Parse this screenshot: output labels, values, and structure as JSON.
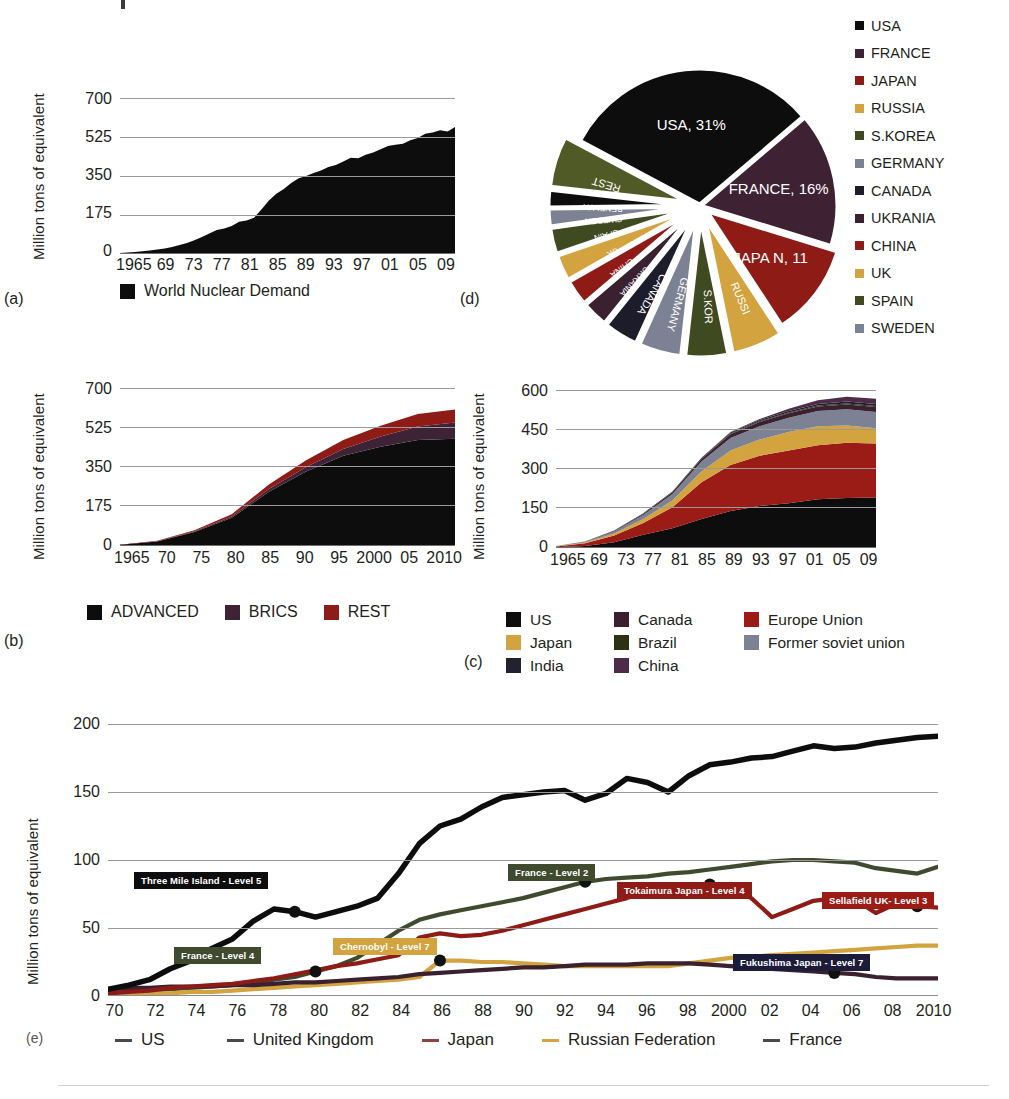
{
  "page": {
    "background": "#ffffff",
    "axis_label": "Million tons of equivalent"
  },
  "panels": {
    "a": {
      "id": "(a)",
      "ylabel": "Million tons of equivalent",
      "yticks": [
        "0",
        "175",
        "350",
        "525",
        "700"
      ],
      "xticks": [
        "1965",
        "69",
        "73",
        "77",
        "81",
        "85",
        "89",
        "93",
        "97",
        "01",
        "05",
        "09"
      ],
      "legend": [
        {
          "label": "World Nuclear Demand",
          "color": "#0d0d0d"
        }
      ]
    },
    "b": {
      "id": "(b)",
      "ylabel": "Million tons of equivalent",
      "yticks": [
        "0",
        "175",
        "350",
        "525",
        "700"
      ],
      "xticks": [
        "1965",
        "70",
        "75",
        "80",
        "85",
        "90",
        "95",
        "2000",
        "05",
        "2010"
      ],
      "legend": [
        {
          "label": "ADVANCED",
          "color": "#0d0d0d"
        },
        {
          "label": "BRICS",
          "color": "#3e2236"
        },
        {
          "label": "REST",
          "color": "#8e1b16"
        }
      ]
    },
    "c": {
      "id": "(c)",
      "ylabel": "Million tons of equivalent",
      "yticks": [
        "0",
        "150",
        "300",
        "450",
        "600"
      ],
      "xticks": [
        "1965",
        "69",
        "73",
        "77",
        "81",
        "85",
        "89",
        "93",
        "97",
        "01",
        "05",
        "09"
      ],
      "legend": [
        {
          "label": "US",
          "color": "#0d0d0d"
        },
        {
          "label": "Canada",
          "color": "#3b2030"
        },
        {
          "label": "Europe Union",
          "color": "#9b1b17"
        },
        {
          "label": "Japan",
          "color": "#d2a33f"
        },
        {
          "label": "Brazil",
          "color": "#2c3315"
        },
        {
          "label": "Former soviet union",
          "color": "#7c8293"
        },
        {
          "label": "India",
          "color": "#22222e"
        },
        {
          "label": "China",
          "color": "#4d2b49"
        }
      ]
    },
    "d": {
      "id": "(d)",
      "legend": [
        {
          "label": "USA",
          "color": "#0d0d0d"
        },
        {
          "label": "FRANCE",
          "color": "#3e2234"
        },
        {
          "label": "JAPAN",
          "color": "#8e1b16"
        },
        {
          "label": "RUSSIA",
          "color": "#d2a33f"
        },
        {
          "label": "S.KOREA",
          "color": "#3f4a21"
        },
        {
          "label": "GERMANY",
          "color": "#7c8293"
        },
        {
          "label": "CANADA",
          "color": "#1c1c2a"
        },
        {
          "label": "UKRANIA",
          "color": "#3b2030"
        },
        {
          "label": "CHINA",
          "color": "#8e1b16"
        },
        {
          "label": "UK",
          "color": "#d2a33f"
        },
        {
          "label": "SPAIN",
          "color": "#3f4a21"
        },
        {
          "label": "SWEDEN",
          "color": "#7c8293"
        }
      ]
    },
    "e": {
      "id": "(e)",
      "ylabel": "Million tons of equivalent",
      "yticks": [
        "0",
        "50",
        "100",
        "150",
        "200"
      ],
      "xticks": [
        "70",
        "72",
        "74",
        "76",
        "78",
        "80",
        "82",
        "84",
        "86",
        "88",
        "90",
        "92",
        "94",
        "96",
        "98",
        "2000",
        "02",
        "04",
        "06",
        "08",
        "2010"
      ],
      "legend": [
        {
          "label": "US",
          "color": "#0d0d0d"
        },
        {
          "label": "United Kingdom",
          "color": "#3b2030"
        },
        {
          "label": "Japan",
          "color": "#8e1b16"
        },
        {
          "label": "Russian Federation",
          "color": "#d2a33f"
        },
        {
          "label": "France",
          "color": "#3f4a2e"
        }
      ],
      "annotations": [
        {
          "text": "Three Mile Island - Level 5",
          "color": "#0d0d0d"
        },
        {
          "text": "France - Level 4",
          "color": "#3f4a2e"
        },
        {
          "text": "Chernobyl - Level 7",
          "color": "#d2a33f"
        },
        {
          "text": "France - Level 2",
          "color": "#3f4a2e"
        },
        {
          "text": "Tokaimura Japan - Level 4",
          "color": "#8e1b16"
        },
        {
          "text": "Fukushima Japan - Level 7",
          "color": "#9b1b17"
        },
        {
          "text": "Sellafield UK- Level 3",
          "color": "#1c1c3a"
        }
      ]
    }
  },
  "chart_data": [
    {
      "key": "a",
      "type": "area",
      "title": "",
      "xlabel": "",
      "ylabel": "Million tons of equivalent",
      "ylim": [
        0,
        700
      ],
      "xlim": [
        1965,
        2010
      ],
      "grid": true,
      "legend_position": "bottom",
      "x": [
        1965,
        1966,
        1967,
        1968,
        1969,
        1970,
        1971,
        1972,
        1973,
        1974,
        1975,
        1976,
        1977,
        1978,
        1979,
        1980,
        1981,
        1982,
        1983,
        1984,
        1985,
        1986,
        1987,
        1988,
        1989,
        1990,
        1991,
        1992,
        1993,
        1994,
        1995,
        1996,
        1997,
        1998,
        1999,
        2000,
        2001,
        2002,
        2003,
        2004,
        2005,
        2006,
        2007,
        2008,
        2009,
        2010
      ],
      "series": [
        {
          "name": "World Nuclear Demand",
          "color": "#0d0d0d",
          "values": [
            5,
            7,
            9,
            12,
            16,
            20,
            25,
            32,
            40,
            50,
            62,
            76,
            92,
            108,
            114,
            125,
            145,
            150,
            163,
            200,
            240,
            270,
            292,
            318,
            340,
            350,
            363,
            375,
            390,
            400,
            415,
            432,
            430,
            445,
            455,
            470,
            485,
            490,
            495,
            510,
            520,
            540,
            545,
            555,
            550,
            570
          ]
        }
      ]
    },
    {
      "key": "b",
      "type": "stacked-area",
      "ylabel": "Million tons of equivalent",
      "ylim": [
        0,
        700
      ],
      "xlim": [
        1965,
        2010
      ],
      "grid": true,
      "legend_position": "bottom",
      "x": [
        1965,
        1970,
        1975,
        1980,
        1985,
        1990,
        1995,
        2000,
        2005,
        2010
      ],
      "series": [
        {
          "name": "ADVANCED",
          "color": "#0d0d0d",
          "values": [
            5,
            20,
            62,
            125,
            240,
            330,
            400,
            440,
            470,
            475
          ]
        },
        {
          "name": "BRICS",
          "color": "#3e2236",
          "values": [
            0,
            1,
            3,
            6,
            12,
            20,
            30,
            45,
            60,
            72
          ]
        },
        {
          "name": "REST",
          "color": "#8e1b16",
          "values": [
            0,
            2,
            5,
            10,
            20,
            30,
            40,
            48,
            55,
            58
          ]
        }
      ]
    },
    {
      "key": "c",
      "type": "stacked-area",
      "ylabel": "Million tons of equivalent",
      "ylim": [
        0,
        600
      ],
      "xlim": [
        1965,
        2010
      ],
      "grid": true,
      "legend_position": "bottom",
      "x": [
        1965,
        1969,
        1973,
        1977,
        1981,
        1985,
        1989,
        1993,
        1997,
        2001,
        2005,
        2009
      ],
      "series": [
        {
          "name": "US",
          "color": "#0d0d0d",
          "values": [
            3,
            8,
            22,
            50,
            75,
            110,
            140,
            160,
            170,
            185,
            190,
            192
          ]
        },
        {
          "name": "Europe Union",
          "color": "#9b1b17",
          "values": [
            3,
            10,
            25,
            45,
            80,
            140,
            175,
            190,
            200,
            205,
            210,
            205
          ]
        },
        {
          "name": "Japan",
          "color": "#d2a33f",
          "values": [
            1,
            3,
            8,
            15,
            25,
            40,
            55,
            62,
            70,
            72,
            65,
            58
          ]
        },
        {
          "name": "Former soviet union",
          "color": "#7c8293",
          "values": [
            1,
            3,
            8,
            15,
            25,
            38,
            48,
            50,
            55,
            58,
            62,
            62
          ]
        },
        {
          "name": "Canada",
          "color": "#3b2030",
          "values": [
            0,
            1,
            2,
            4,
            7,
            10,
            14,
            16,
            17,
            17,
            18,
            18
          ]
        },
        {
          "name": "Brazil",
          "color": "#2c3315",
          "values": [
            0,
            0,
            0,
            1,
            1,
            2,
            3,
            3,
            3,
            4,
            4,
            4
          ]
        },
        {
          "name": "India",
          "color": "#22222e",
          "values": [
            0,
            0,
            1,
            2,
            2,
            3,
            4,
            5,
            5,
            6,
            7,
            8
          ]
        },
        {
          "name": "China",
          "color": "#4d2b49",
          "values": [
            0,
            0,
            0,
            0,
            0,
            0,
            1,
            4,
            9,
            14,
            18,
            20
          ]
        }
      ]
    },
    {
      "key": "d",
      "type": "pie",
      "title": "",
      "legend_position": "right",
      "labels": [
        "USA",
        "FRANCE",
        "JAPAN",
        "RUSSIA",
        "S.KOREA",
        "GERMANY",
        "CANADA",
        "UKRANIA",
        "CHINA",
        "UK",
        "SPAIN",
        "SWEDEN",
        "BENELUX",
        "REST"
      ],
      "slice_text": [
        "USA, 31%",
        "FRANCE, 16%",
        "JAPA N, 11",
        "RUSSI",
        "S.KOR",
        "GERMANY",
        "CANADA",
        "UKRANIA",
        "CHINA",
        "UK",
        "SPAIN",
        "SWEDEN",
        "BENELUX",
        "REST"
      ],
      "values": [
        31,
        16,
        11,
        6,
        5,
        5,
        4,
        3,
        3,
        3,
        3,
        2,
        2,
        6
      ],
      "colors": [
        "#0d0d0d",
        "#3e2234",
        "#8e1b16",
        "#d2a33f",
        "#3f4a21",
        "#7c8293",
        "#1c1c2a",
        "#3b2030",
        "#8e1b16",
        "#d2a33f",
        "#3f4a21",
        "#7c8293",
        "#0d0d0d",
        "#4f5a27"
      ]
    },
    {
      "key": "e",
      "type": "line",
      "ylabel": "Million tons of equivalent",
      "ylim": [
        0,
        200
      ],
      "xlim": [
        1970,
        2010
      ],
      "grid": true,
      "legend_position": "bottom",
      "x": [
        1970,
        1971,
        1972,
        1973,
        1974,
        1975,
        1976,
        1977,
        1978,
        1979,
        1980,
        1981,
        1982,
        1983,
        1984,
        1985,
        1986,
        1987,
        1988,
        1989,
        1990,
        1991,
        1992,
        1993,
        1994,
        1995,
        1996,
        1997,
        1998,
        1999,
        2000,
        2001,
        2002,
        2003,
        2004,
        2005,
        2006,
        2007,
        2008,
        2009,
        2010
      ],
      "series": [
        {
          "name": "US",
          "color": "#0d0d0d",
          "values": [
            5,
            8,
            12,
            20,
            26,
            35,
            42,
            55,
            64,
            62,
            58,
            62,
            66,
            72,
            90,
            112,
            125,
            130,
            139,
            146,
            148,
            150,
            151,
            144,
            149,
            160,
            157,
            150,
            162,
            170,
            172,
            175,
            176,
            180,
            184,
            182,
            183,
            186,
            188,
            190,
            191
          ]
        },
        {
          "name": "France",
          "color": "#3f4a2e",
          "values": [
            2,
            3,
            4,
            5,
            6,
            7,
            8,
            10,
            12,
            14,
            18,
            22,
            28,
            38,
            48,
            56,
            60,
            63,
            66,
            69,
            72,
            76,
            80,
            84,
            86,
            87,
            88,
            90,
            91,
            93,
            95,
            97,
            99,
            100,
            100,
            99,
            98,
            94,
            92,
            90,
            95
          ]
        },
        {
          "name": "Japan",
          "color": "#8e1b16",
          "values": [
            2,
            3,
            4,
            6,
            7,
            8,
            9,
            11,
            13,
            16,
            19,
            22,
            24,
            27,
            30,
            43,
            46,
            44,
            45,
            48,
            52,
            56,
            60,
            64,
            68,
            72,
            77,
            79,
            80,
            82,
            79,
            72,
            58,
            64,
            70,
            72,
            71,
            61,
            68,
            66,
            65
          ]
        },
        {
          "name": "Russian Federation",
          "color": "#d2a33f",
          "values": [
            1,
            1,
            2,
            2,
            3,
            3,
            4,
            5,
            6,
            7,
            8,
            9,
            10,
            11,
            12,
            14,
            26,
            26,
            25,
            25,
            24,
            23,
            22,
            22,
            22,
            22,
            22,
            22,
            24,
            26,
            28,
            29,
            30,
            31,
            32,
            33,
            34,
            35,
            36,
            37,
            37
          ]
        },
        {
          "name": "United Kingdom",
          "color": "#3b2030",
          "values": [
            5,
            6,
            6,
            7,
            7,
            7,
            8,
            8,
            9,
            10,
            10,
            11,
            12,
            13,
            14,
            16,
            17,
            18,
            19,
            20,
            21,
            21,
            22,
            23,
            23,
            23,
            24,
            24,
            24,
            23,
            22,
            21,
            20,
            19,
            18,
            17,
            16,
            14,
            13,
            13,
            13
          ]
        }
      ],
      "event_markers": [
        {
          "text": "Three Mile Island - Level 5",
          "year": 1979,
          "series": "US",
          "color": "#0d0d0d"
        },
        {
          "text": "France - Level 4",
          "year": 1980,
          "series": "France",
          "color": "#3f4a2e"
        },
        {
          "text": "Chernobyl - Level 7",
          "year": 1986,
          "series": "Russian Federation",
          "color": "#d2a33f"
        },
        {
          "text": "France - Level 2",
          "year": 1993,
          "series": "France",
          "color": "#3f4a2e"
        },
        {
          "text": "Tokaimura Japan - Level 4",
          "year": 1999,
          "series": "Japan",
          "color": "#8e1b16"
        },
        {
          "text": "Sellafield UK- Level 3",
          "year": 2005,
          "series": "United Kingdom",
          "color": "#1c1c3a"
        },
        {
          "text": "Fukushima Japan - Level 7",
          "year": 2009,
          "series": "Japan",
          "color": "#9b1b17"
        }
      ]
    }
  ]
}
